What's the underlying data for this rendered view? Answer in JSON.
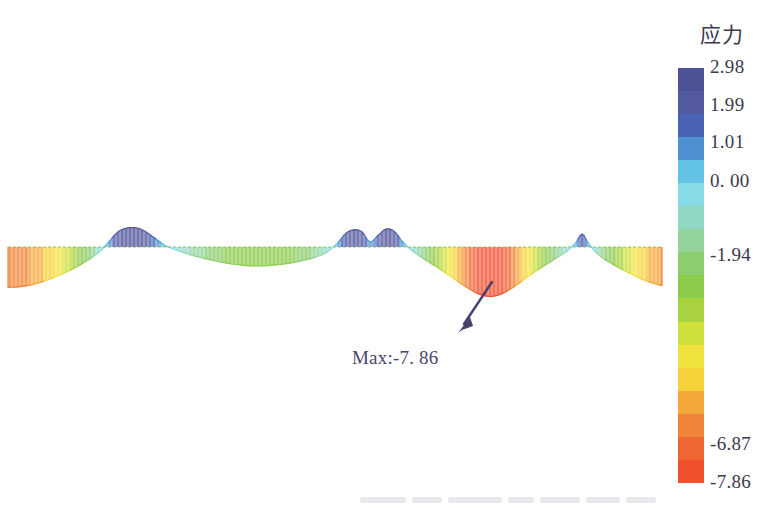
{
  "figure": {
    "kind": "stress-contour-diagram",
    "background_color": "#ffffff"
  },
  "annotation": {
    "max_label": "Max:-7. 86",
    "max_value": -7.86,
    "text_color": "#4a4668",
    "arrow_color": "#4a3f6b",
    "arrow_from": {
      "x": 460,
      "y": 333
    },
    "arrow_to": {
      "x": 487,
      "y": 287
    }
  },
  "colorbar": {
    "title": "应力",
    "title_color": "#3a3a4c",
    "tick_color": "#3a3a4c",
    "ticks": [
      "2.98",
      "1.99",
      "1.01",
      "0. 00",
      "-1.94",
      "-6.87",
      "-7.86"
    ],
    "tick_values": [
      2.98,
      1.99,
      1.01,
      0.0,
      -1.94,
      -6.87,
      -7.86
    ],
    "vmax": 2.98,
    "vmin": -7.86,
    "segments": [
      "#4e5398",
      "#545aa0",
      "#4a63b4",
      "#4e8fd0",
      "#62c3e4",
      "#86dbe6",
      "#8fd9c4",
      "#92d49a",
      "#8ccd6e",
      "#8ccb4c",
      "#a8d23f",
      "#cfe03c",
      "#f0e33e",
      "#f6d23a",
      "#f5a83a",
      "#f08438",
      "#ef6534",
      "#f0502e"
    ]
  },
  "chart_data": {
    "type": "area",
    "title": "应力",
    "xlabel": "",
    "ylabel": "应力",
    "ylim": [
      -7.86,
      2.98
    ],
    "grid": false,
    "legend": "colorbar-right",
    "neutral_axis_y": 97,
    "x_start": 8,
    "x_end": 662,
    "annotations": [
      {
        "text": "Max:-7. 86",
        "x": 352,
        "y": 347,
        "value": -7.86
      }
    ],
    "series": [
      {
        "name": "stress envelope",
        "x": [
          8,
          20,
          34,
          48,
          62,
          76,
          90,
          100,
          110,
          118,
          126,
          134,
          142,
          152,
          164,
          178,
          194,
          212,
          232,
          252,
          272,
          292,
          312,
          326,
          338,
          346,
          354,
          362,
          370,
          378,
          386,
          394,
          402,
          412,
          424,
          438,
          452,
          466,
          478,
          490,
          502,
          514,
          526,
          540,
          554,
          566,
          576,
          582,
          588,
          596,
          606,
          618,
          630,
          642,
          652,
          662
        ],
        "values": [
          -6.4,
          -6.3,
          -5.9,
          -5.2,
          -4.3,
          -3.2,
          -1.9,
          -0.7,
          0.9,
          2.1,
          2.6,
          2.7,
          2.4,
          1.5,
          0.3,
          -0.6,
          -1.4,
          -2.1,
          -2.7,
          -3.0,
          -2.9,
          -2.5,
          -1.8,
          -0.9,
          0.6,
          1.9,
          2.4,
          2.1,
          0.7,
          1.6,
          2.5,
          2.2,
          0.8,
          -0.6,
          -1.9,
          -3.3,
          -4.8,
          -6.3,
          -7.4,
          -7.86,
          -7.4,
          -6.3,
          -4.9,
          -3.4,
          -2.0,
          -0.8,
          0.6,
          1.8,
          0.6,
          -0.9,
          -2.1,
          -3.2,
          -4.2,
          -5.1,
          -5.7,
          -6.1
        ]
      }
    ]
  }
}
